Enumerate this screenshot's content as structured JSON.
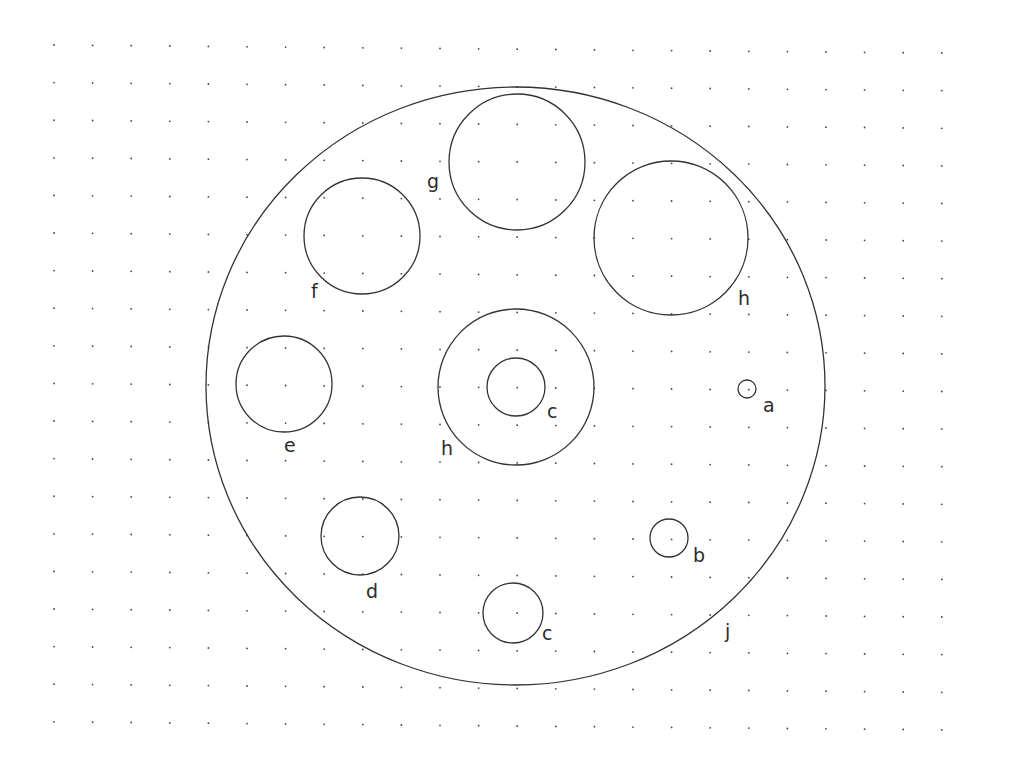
{
  "drawing": {
    "background": "#ffffff",
    "stroke_color": "#333333",
    "grid": {
      "origin_x": 54,
      "origin_y": 45,
      "spacing_x": 38.6,
      "spacing_y": 37.6,
      "cols": 24,
      "rows": 19,
      "dot_color": "#444444"
    },
    "outer_circle": {
      "id": "j",
      "cx": 515.5,
      "cy": 386,
      "rx": 309.5,
      "ry": 299,
      "label": "j",
      "label_x": 725,
      "label_y": 638
    },
    "circles": [
      {
        "id": "g",
        "cx": 517,
        "cy": 162,
        "r": 68,
        "label": "g",
        "label_x": 427,
        "label_y": 188
      },
      {
        "id": "f",
        "cx": 362,
        "cy": 236,
        "r": 58,
        "label": "f",
        "label_x": 311,
        "label_y": 298
      },
      {
        "id": "h1",
        "cx": 671,
        "cy": 238,
        "r": 77,
        "label": "h",
        "label_x": 738,
        "label_y": 305
      },
      {
        "id": "h2",
        "cx": 516,
        "cy": 387,
        "r": 78,
        "label": "h",
        "label_x": 441,
        "label_y": 455
      },
      {
        "id": "c1",
        "cx": 516,
        "cy": 387,
        "r": 29,
        "label": "c",
        "label_x": 547,
        "label_y": 418
      },
      {
        "id": "e",
        "cx": 284,
        "cy": 384,
        "r": 48,
        "label": "e",
        "label_x": 284,
        "label_y": 452
      },
      {
        "id": "a",
        "cx": 747,
        "cy": 389,
        "r": 9,
        "label": "a",
        "label_x": 763,
        "label_y": 412
      },
      {
        "id": "d",
        "cx": 360,
        "cy": 536,
        "r": 39,
        "label": "d",
        "label_x": 366,
        "label_y": 598
      },
      {
        "id": "b",
        "cx": 669,
        "cy": 538,
        "r": 19,
        "label": "b",
        "label_x": 693,
        "label_y": 562
      },
      {
        "id": "c2",
        "cx": 513,
        "cy": 613,
        "r": 30,
        "label": "c",
        "label_x": 542,
        "label_y": 640
      }
    ]
  }
}
